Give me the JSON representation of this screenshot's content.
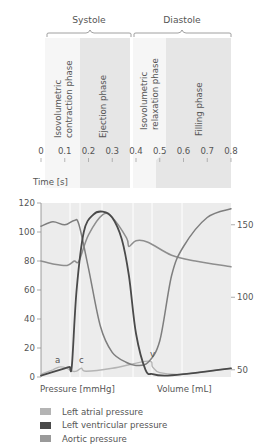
{
  "chart_data": {
    "type": "line",
    "title": "",
    "phase_groups": [
      {
        "label": "Systole",
        "x_start": 0.02,
        "x_end": 0.37
      },
      {
        "label": "Diastole",
        "x_start": 0.38,
        "x_end": 0.8
      }
    ],
    "phases": [
      {
        "label": "Isovolumetric contraction phase",
        "line1": "Isovolumetric",
        "line2": "contraction phase",
        "x_start": 0.02,
        "x_end": 0.17
      },
      {
        "label": "Ejection phase",
        "line1": "Ejection phase",
        "line2": "",
        "x_start": 0.17,
        "x_end": 0.38
      },
      {
        "label": "Isovolumetric relaxation phase",
        "line1": "Isovolumetric",
        "line2": "relaxation phase",
        "x_start": 0.39,
        "x_end": 0.52
      },
      {
        "label": "Filling phase",
        "line1": "Filling phase",
        "line2": "",
        "x_start": 0.52,
        "x_end": 0.8
      }
    ],
    "xlabel": "Time [s]",
    "x_ticks": [
      "0",
      "0.1",
      "0.2",
      "0.3",
      "0.4",
      "0.5",
      "0.6",
      "0.7",
      "0.8"
    ],
    "xlim": [
      0,
      0.8
    ],
    "ylabel_left": "Pressure [mmHg]",
    "y_ticks_left": [
      "0",
      "20",
      "40",
      "60",
      "80",
      "100",
      "120"
    ],
    "ylim_left": [
      0,
      120
    ],
    "ylabel_right": "Volume [mL]",
    "y_ticks_right": [
      "50",
      "100",
      "150"
    ],
    "ylim_right": [
      45,
      165
    ],
    "annotations": [
      {
        "text": "a",
        "x": 0.07,
        "y": 7
      },
      {
        "text": "c",
        "x": 0.17,
        "y": 7
      },
      {
        "text": "v",
        "x": 0.47,
        "y": 11
      }
    ],
    "series": [
      {
        "name": "Left atrial pressure",
        "color": "#b0b0b0",
        "axis": "left",
        "x": [
          0,
          0.05,
          0.08,
          0.11,
          0.13,
          0.15,
          0.17,
          0.19,
          0.3,
          0.45,
          0.47,
          0.5,
          0.6,
          0.8
        ],
        "y": [
          2,
          5,
          7,
          6,
          4,
          4,
          6,
          4,
          6,
          11,
          7,
          3,
          2,
          6
        ]
      },
      {
        "name": "Left ventricular pressure",
        "color": "#555555",
        "axis": "left",
        "x": [
          0,
          0.1,
          0.12,
          0.13,
          0.15,
          0.18,
          0.22,
          0.26,
          0.3,
          0.34,
          0.37,
          0.4,
          0.44,
          0.47,
          0.52,
          0.6,
          0.8
        ],
        "y": [
          1,
          6,
          7,
          8,
          60,
          100,
          112,
          114,
          110,
          95,
          70,
          30,
          5,
          2,
          1,
          2,
          6
        ]
      },
      {
        "name": "Aortic pressure",
        "color": "#909090",
        "axis": "left",
        "x": [
          0,
          0.05,
          0.11,
          0.14,
          0.16,
          0.2,
          0.26,
          0.3,
          0.36,
          0.37,
          0.4,
          0.45,
          0.55,
          0.65,
          0.8
        ],
        "y": [
          80,
          78,
          77,
          80,
          80,
          98,
          112,
          110,
          96,
          90,
          94,
          93,
          84,
          80,
          76
        ]
      },
      {
        "name": "Left ventricular volume",
        "color": "#888888",
        "axis": "right",
        "x": [
          0,
          0.05,
          0.1,
          0.14,
          0.16,
          0.2,
          0.25,
          0.3,
          0.36,
          0.4,
          0.45,
          0.5,
          0.55,
          0.6,
          0.7,
          0.8
        ],
        "y": [
          149,
          152,
          150,
          153,
          150,
          120,
          80,
          62,
          55,
          53,
          55,
          70,
          115,
          135,
          155,
          161
        ]
      }
    ],
    "grid": false,
    "legend_position": "bottom"
  },
  "legend": {
    "items": [
      {
        "label": "Left atrial pressure",
        "color": "#b4b4b4"
      },
      {
        "label": "Left ventricular pressure",
        "color": "#4a4a4a"
      },
      {
        "label": "Aortic pressure",
        "color": "#9a9a9a"
      }
    ]
  }
}
